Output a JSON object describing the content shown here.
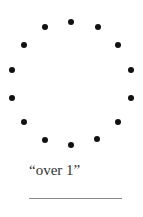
{
  "figure": {
    "dot_color": "#111111",
    "dot_count": 14,
    "dots": [
      {
        "x": 71,
        "y": 22
      },
      {
        "x": 98,
        "y": 27
      },
      {
        "x": 118,
        "y": 45
      },
      {
        "x": 131,
        "y": 70
      },
      {
        "x": 131,
        "y": 98
      },
      {
        "x": 118,
        "y": 122
      },
      {
        "x": 97,
        "y": 139
      },
      {
        "x": 71,
        "y": 145
      },
      {
        "x": 45,
        "y": 140
      },
      {
        "x": 24,
        "y": 122
      },
      {
        "x": 12,
        "y": 98
      },
      {
        "x": 12,
        "y": 70
      },
      {
        "x": 24,
        "y": 45
      },
      {
        "x": 45,
        "y": 27
      }
    ]
  },
  "caption": {
    "text": "“over 1”"
  },
  "answer_line": {
    "color": "#8a8a8a"
  }
}
